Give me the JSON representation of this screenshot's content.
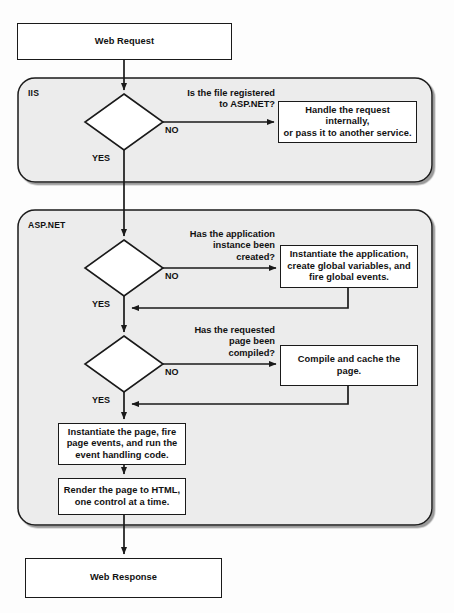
{
  "diagram": {
    "background_color": "#fdfdfd",
    "panel_fill": "#ececec",
    "line_color": "#1a1a1a"
  },
  "panels": [
    {
      "id": "iis",
      "label": "IIS"
    },
    {
      "id": "aspnet",
      "label": "ASP.NET"
    }
  ],
  "nodes": {
    "web_request": "Web Request",
    "handle_internally": "Handle the request internally,\nor pass it to another service.",
    "instantiate_app": "Instantiate the application,\ncreate global variables, and\nfire global events.",
    "compile_cache": "Compile and  cache the page.",
    "instantiate_page": "Instantiate the page, fire\npage events, and run the\nevent handling code.",
    "render_page": "Render the page to HTML,\none control at a time.",
    "web_response": "Web Response"
  },
  "decisions": {
    "file_registered": "Is the file registered\nto ASP.NET?",
    "app_instance": "Has the application\ninstance been\ncreated?",
    "page_compiled": "Has the requested\npage been\ncompiled?"
  },
  "branch_labels": {
    "no": "NO",
    "yes": "YES"
  }
}
